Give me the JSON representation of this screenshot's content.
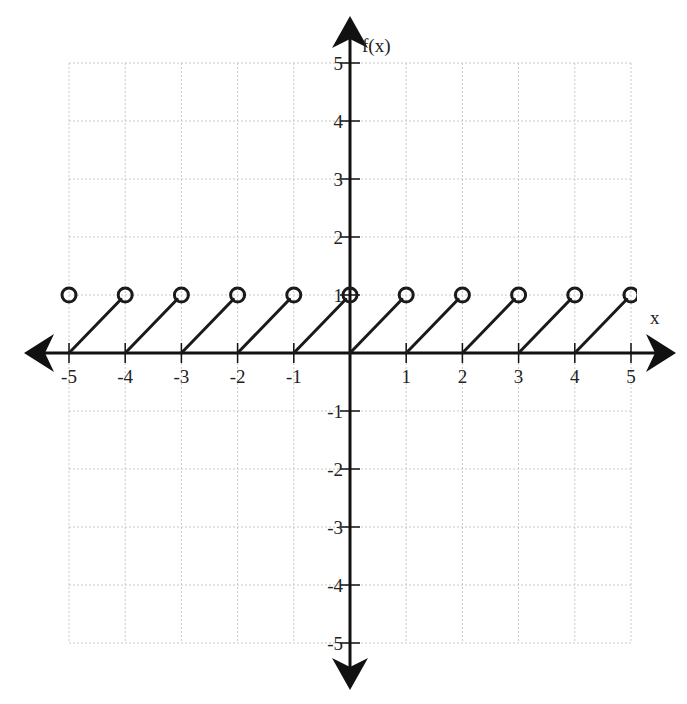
{
  "chart_data": {
    "type": "line",
    "title": "",
    "xlabel": "x",
    "ylabel": "f(x)",
    "xlim": [
      -5,
      5
    ],
    "ylim": [
      -5,
      5
    ],
    "grid": true,
    "x_ticks": [
      -5,
      -4,
      -3,
      -2,
      -1,
      1,
      2,
      3,
      4,
      5
    ],
    "y_ticks": [
      -5,
      -4,
      -3,
      -2,
      -1,
      1,
      2,
      3,
      4,
      5
    ],
    "x_tick_labels": [
      "-5",
      "-4",
      "-3",
      "-2",
      "-1",
      "1",
      "2",
      "3",
      "4",
      "5"
    ],
    "y_tick_labels": [
      "-5",
      "-4",
      "-3",
      "-2",
      "-1",
      "1",
      "2",
      "3",
      "4",
      "5"
    ],
    "function": "f(x) = x - floor(x)",
    "series": [
      {
        "name": "sawtooth",
        "segments": [
          {
            "x": [
              -5,
              -4
            ],
            "y": [
              0,
              1
            ]
          },
          {
            "x": [
              -4,
              -3
            ],
            "y": [
              0,
              1
            ]
          },
          {
            "x": [
              -3,
              -2
            ],
            "y": [
              0,
              1
            ]
          },
          {
            "x": [
              -2,
              -1
            ],
            "y": [
              0,
              1
            ]
          },
          {
            "x": [
              -1,
              0
            ],
            "y": [
              0,
              1
            ]
          },
          {
            "x": [
              0,
              1
            ],
            "y": [
              0,
              1
            ]
          },
          {
            "x": [
              1,
              2
            ],
            "y": [
              0,
              1
            ]
          },
          {
            "x": [
              2,
              3
            ],
            "y": [
              0,
              1
            ]
          },
          {
            "x": [
              3,
              4
            ],
            "y": [
              0,
              1
            ]
          },
          {
            "x": [
              4,
              5
            ],
            "y": [
              0,
              1
            ]
          }
        ],
        "open_points": [
          {
            "x": -5,
            "y": 1
          },
          {
            "x": -4,
            "y": 1
          },
          {
            "x": -3,
            "y": 1
          },
          {
            "x": -2,
            "y": 1
          },
          {
            "x": -1,
            "y": 1
          },
          {
            "x": 0,
            "y": 1
          },
          {
            "x": 1,
            "y": 1
          },
          {
            "x": 2,
            "y": 1
          },
          {
            "x": 3,
            "y": 1
          },
          {
            "x": 4,
            "y": 1
          },
          {
            "x": 5,
            "y": 1
          }
        ]
      }
    ],
    "colors": {
      "axis": "#111111",
      "grid": "#c8c8c8",
      "series": "#1a1a1a"
    }
  }
}
